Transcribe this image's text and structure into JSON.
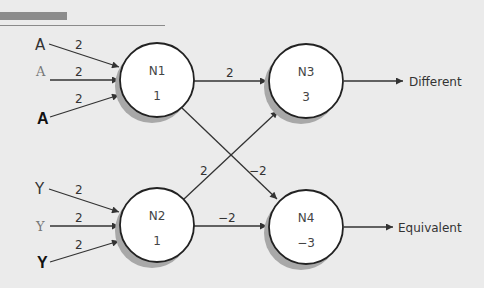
{
  "header": {
    "bar_color": "#8c8c8c",
    "rule_color": "#8a8a8a"
  },
  "colors": {
    "background": "#ebebeb",
    "node_fill": "#ffffff",
    "node_stroke": "#222222",
    "node_shadow": "#a8a8a8",
    "edge": "#333333"
  },
  "inputs": {
    "a_regular": "A",
    "a_serif": "A",
    "a_bold": "A",
    "y_regular": "Y",
    "y_serif": "Y",
    "y_bold": "Y"
  },
  "nodes": {
    "n1": {
      "name": "N1",
      "threshold": "1"
    },
    "n2": {
      "name": "N2",
      "threshold": "1"
    },
    "n3": {
      "name": "N3",
      "threshold": "3"
    },
    "n4": {
      "name": "N4",
      "threshold": "−3"
    }
  },
  "weights": {
    "a_regular_n1": "2",
    "a_serif_n1": "2",
    "a_bold_n1": "2",
    "y_regular_n2": "2",
    "y_serif_n2": "2",
    "y_bold_n2": "2",
    "n1_n3": "2",
    "n1_n4": "−2",
    "n2_n3": "2",
    "n2_n4": "−2"
  },
  "outputs": {
    "n3": "Different",
    "n4": "Equivalent"
  }
}
